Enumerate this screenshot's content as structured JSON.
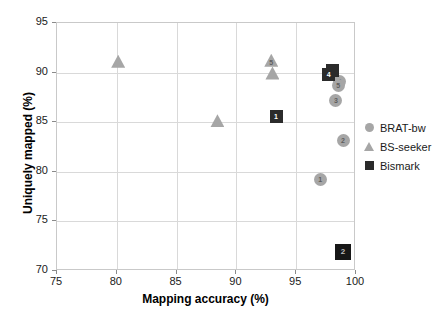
{
  "chart_data": {
    "type": "scatter",
    "title": "",
    "xlabel": "Mapping accuracy (%)",
    "ylabel": "Uniquely mapped (%)",
    "xlim": [
      75,
      100
    ],
    "ylim": [
      70,
      95
    ],
    "xticks": [
      75,
      80,
      85,
      90,
      95,
      100
    ],
    "yticks": [
      70,
      75,
      80,
      85,
      90,
      95
    ],
    "grid": true,
    "legend_position": "right",
    "series": [
      {
        "name": "BRAT-bw",
        "marker": "circle",
        "color": "#a6a6a6",
        "points": [
          {
            "label": "1",
            "x": 97.1,
            "y": 79.1
          },
          {
            "label": "2",
            "x": 99.0,
            "y": 83.1
          },
          {
            "label": "3",
            "x": 98.4,
            "y": 87.1
          },
          {
            "label": "4",
            "x": 98.7,
            "y": 89.0
          },
          {
            "label": "5",
            "x": 98.6,
            "y": 88.6
          }
        ]
      },
      {
        "name": "BS-seeker",
        "marker": "triangle",
        "color": "#a6a6a6",
        "points": [
          {
            "label": "",
            "x": 80.2,
            "y": 91.0
          },
          {
            "label": "",
            "x": 88.5,
            "y": 85.0
          },
          {
            "label": "5",
            "x": 93.0,
            "y": 91.1
          },
          {
            "label": "",
            "x": 93.1,
            "y": 89.8
          }
        ]
      },
      {
        "name": "Bismark",
        "marker": "square",
        "color": "#2b2b2b",
        "points": [
          {
            "label": "1",
            "x": 93.4,
            "y": 85.5
          },
          {
            "label": "2",
            "x": 99.0,
            "y": 71.8
          },
          {
            "label": "3",
            "x": 98.1,
            "y": 90.1
          },
          {
            "label": "4",
            "x": 97.8,
            "y": 89.7
          }
        ]
      }
    ]
  },
  "legend": {
    "items": [
      {
        "label": "BRAT-bw",
        "marker": "circle"
      },
      {
        "label": "BS-seeker",
        "marker": "triangle"
      },
      {
        "label": "Bismark",
        "marker": "square"
      }
    ]
  }
}
